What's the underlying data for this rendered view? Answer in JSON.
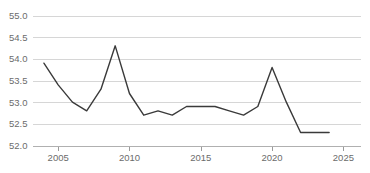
{
  "chart_data": {
    "type": "line",
    "title": "",
    "subtitle": "",
    "xlabel": "",
    "ylabel": "",
    "xlim": [
      2003.2,
      2026.2
    ],
    "ylim": [
      52.0,
      55.0
    ],
    "grid": true,
    "legend": false,
    "legend_position": "none",
    "markers": false,
    "line_color": "#3a3a3a",
    "grid_color": "#d6d6d6",
    "axis_color": "#b0b0b0",
    "label_color": "#6b6b6b",
    "background_color": "#ffffff",
    "y_ticks": [
      "52.0",
      "52.5",
      "53.0",
      "53.5",
      "54.0",
      "54.5",
      "55.0"
    ],
    "y_tick_values": [
      52.0,
      52.5,
      53.0,
      53.5,
      54.0,
      54.5,
      55.0
    ],
    "x_ticks": [
      "2005",
      "2010",
      "2015",
      "2020",
      "2025"
    ],
    "x_tick_values": [
      2005,
      2010,
      2015,
      2020,
      2025
    ],
    "x": [
      2004,
      2005,
      2006,
      2007,
      2008,
      2009,
      2010,
      2011,
      2012,
      2013,
      2014,
      2015,
      2016,
      2017,
      2018,
      2019,
      2020,
      2021,
      2022,
      2023,
      2024
    ],
    "values": [
      53.9,
      53.4,
      53.0,
      52.8,
      53.3,
      54.3,
      53.2,
      52.7,
      52.8,
      52.7,
      52.9,
      52.9,
      52.9,
      52.8,
      52.7,
      52.9,
      53.8,
      53.0,
      52.3,
      52.3,
      52.3
    ],
    "series": [
      {
        "name": "",
        "values": [
          53.9,
          53.4,
          53.0,
          52.8,
          53.3,
          54.3,
          53.2,
          52.7,
          52.8,
          52.7,
          52.9,
          52.9,
          52.9,
          52.8,
          52.7,
          52.9,
          53.8,
          53.0,
          52.3,
          52.3,
          52.3
        ]
      }
    ],
    "annotations": []
  }
}
